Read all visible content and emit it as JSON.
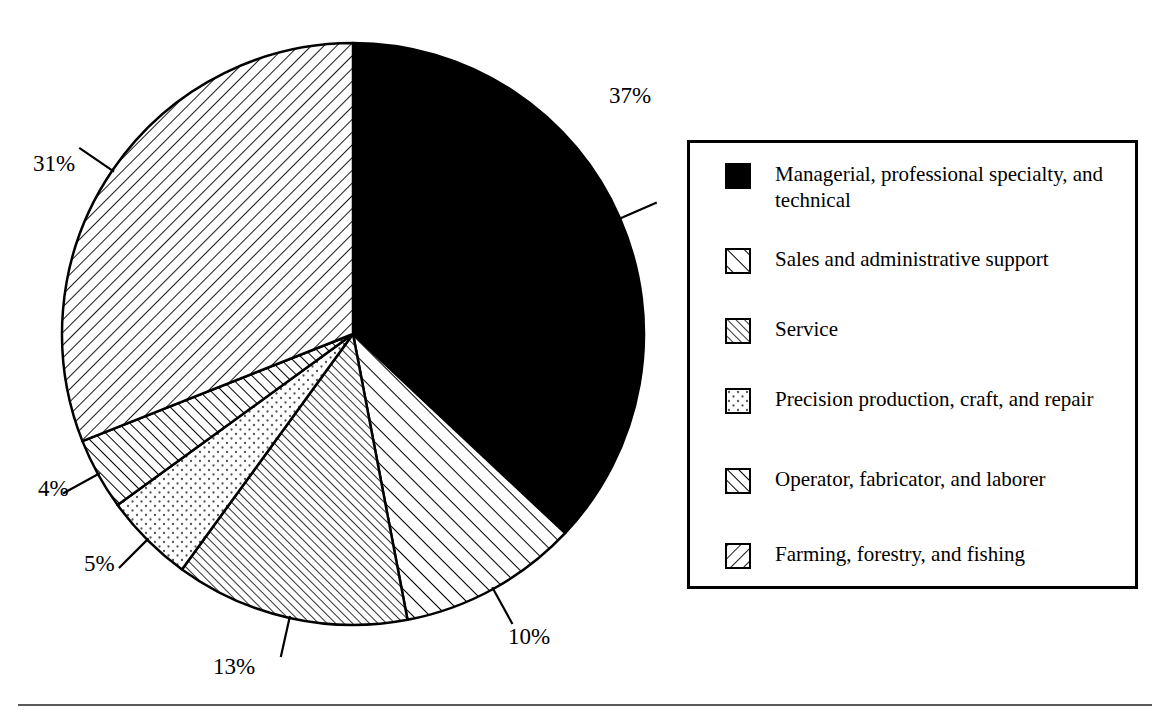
{
  "chart_data": {
    "type": "pie",
    "title": "",
    "subtitle": "",
    "xlabel": "",
    "ylabel": "",
    "legend_position": "right",
    "grid": false,
    "units": "percent",
    "start_angle_deg": 0,
    "direction": "clockwise",
    "categories": [
      "Managerial, professional specialty, and technical",
      "Sales and administrative support",
      "Service",
      "Precision production, craft, and repair",
      "Operator, fabricator, and laborer",
      "Farming, forestry, and fishing"
    ],
    "values": [
      37,
      10,
      13,
      5,
      4,
      31
    ],
    "value_labels": [
      "37%",
      "10%",
      "13%",
      "5%",
      "4%",
      "31%"
    ],
    "slices": [
      {
        "label": "Managerial, professional specialty, and technical",
        "value": 37,
        "value_label": "37%",
        "pattern": "solid-black",
        "color": "#000000"
      },
      {
        "label": "Sales and administrative support",
        "value": 10,
        "value_label": "10%",
        "pattern": "diagonal-forward-sparse",
        "color": "#000000"
      },
      {
        "label": "Service",
        "value": 13,
        "value_label": "13%",
        "pattern": "diagonal-forward-dense",
        "color": "#000000"
      },
      {
        "label": "Precision production, craft, and repair",
        "value": 5,
        "value_label": "5%",
        "pattern": "dots",
        "color": "#000000"
      },
      {
        "label": "Operator, fabricator, and laborer",
        "value": 4,
        "value_label": "4%",
        "pattern": "diagonal-forward-medium",
        "color": "#000000"
      },
      {
        "label": "Farming, forestry, and fishing",
        "value": 31,
        "value_label": "31%",
        "pattern": "diagonal-back-sparse",
        "color": "#000000"
      }
    ]
  },
  "pie": {
    "center_x": 353,
    "center_y": 334,
    "radius": 291,
    "outline_color": "#000000",
    "labels": [
      {
        "text": "37%",
        "left": 609,
        "top": 84
      },
      {
        "text": "10%",
        "left": 508,
        "top": 625
      },
      {
        "text": "13%",
        "left": 213,
        "top": 655
      },
      {
        "text": "5%",
        "left": 84,
        "top": 552
      },
      {
        "text": "4%",
        "left": 38,
        "top": 477
      },
      {
        "text": "31%",
        "left": 33,
        "top": 152
      }
    ]
  },
  "legend": {
    "items": [
      {
        "label": "Managerial, professional specialty, and technical",
        "pattern": "solid-black"
      },
      {
        "label": "Sales and administrative support",
        "pattern": "diagonal-forward-sparse"
      },
      {
        "label": "Service",
        "pattern": "diagonal-forward-dense"
      },
      {
        "label": "Precision production, craft, and repair",
        "pattern": "dots"
      },
      {
        "label": "Operator, fabricator, and laborer",
        "pattern": "diagonal-forward-medium"
      },
      {
        "label": "Farming, forestry, and fishing",
        "pattern": "diagonal-back-sparse"
      }
    ]
  }
}
